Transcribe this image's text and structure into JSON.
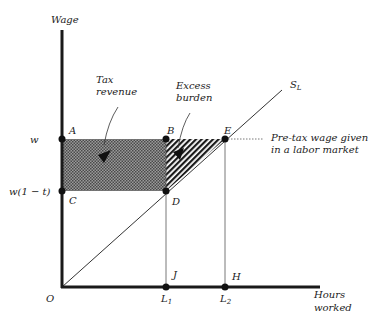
{
  "diagram": {
    "type": "labor-market-tax-incidence",
    "axes": {
      "y_label": "Wage",
      "x_label_line1": "Hours",
      "x_label_line2": "worked",
      "origin_label": "O"
    },
    "wage_levels": {
      "pre_tax": "w",
      "post_tax": "w(1 − t)"
    },
    "quantities": {
      "l1": "L",
      "l1_sub": "1",
      "l2": "L",
      "l2_sub": "2"
    },
    "points": {
      "A": "A",
      "B": "B",
      "C": "C",
      "D": "D",
      "E": "E",
      "J": "J",
      "H": "H"
    },
    "supply_curve": {
      "label": "S",
      "label_sub": "L"
    },
    "regions": {
      "tax_revenue_line1": "Tax",
      "tax_revenue_line2": "revenue",
      "excess_burden_line1": "Excess",
      "excess_burden_line2": "burden"
    },
    "annotation": {
      "line1": "Pre-tax  wage given",
      "line2": "in a  labor market"
    },
    "colors": {
      "axis": "#1a1a1a",
      "tax_fill": "#7a7a7a",
      "burden_fill": "#2a2a2a",
      "line": "#333333"
    }
  }
}
